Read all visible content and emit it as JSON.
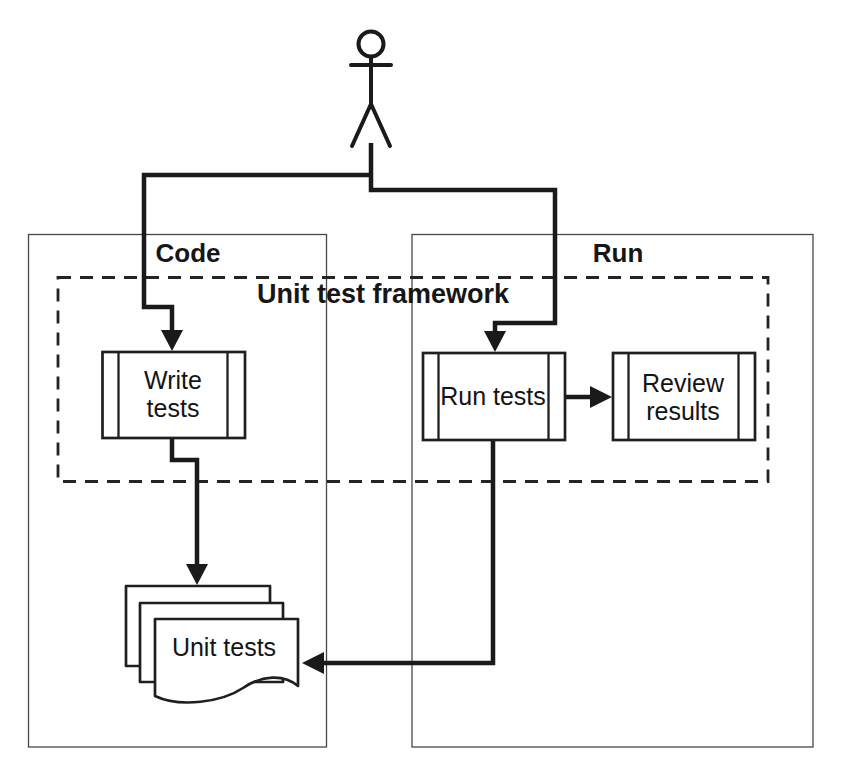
{
  "diagram_type": "activity-swimlane-diagram",
  "lanes": {
    "code": {
      "label": "Code"
    },
    "run": {
      "label": "Run"
    }
  },
  "frame": {
    "label": "Unit test framework"
  },
  "nodes": {
    "write_tests": {
      "line1": "Write",
      "line2": "tests"
    },
    "run_tests": {
      "line1": "Run tests"
    },
    "review_results": {
      "line1": "Review",
      "line2": "results"
    },
    "unit_tests": {
      "line1": "Unit tests"
    }
  },
  "actor": {
    "name": "user"
  },
  "edges": [
    {
      "from": "actor",
      "to": "write_tests"
    },
    {
      "from": "actor",
      "to": "run_tests"
    },
    {
      "from": "write_tests",
      "to": "unit_tests"
    },
    {
      "from": "run_tests",
      "to": "review_results"
    },
    {
      "from": "run_tests",
      "to": "unit_tests"
    }
  ],
  "colors": {
    "line": "#1a1a1a",
    "node_border": "#1f1f1f",
    "lane_border": "#484848",
    "background": "#fefefe",
    "text": "#141414"
  }
}
